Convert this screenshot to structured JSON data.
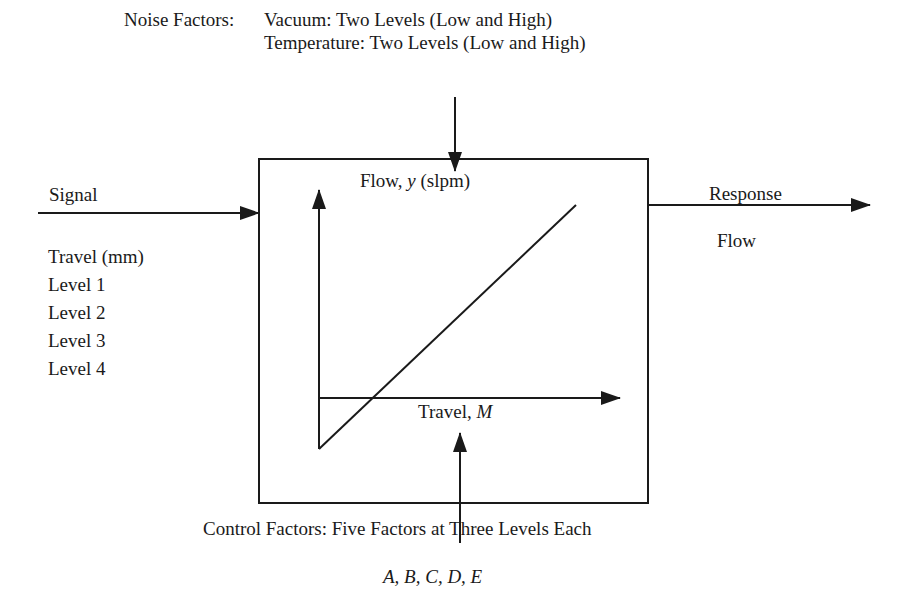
{
  "noise": {
    "label": "Noise Factors:",
    "line1": "Vacuum:  Two Levels (Low and High)",
    "line2": "Temperature: Two Levels (Low and High)"
  },
  "signal": {
    "label": "Signal",
    "heading": "Travel (mm)",
    "levels": [
      "Level 1",
      "Level 2",
      "Level 3",
      "Level 4"
    ]
  },
  "response": {
    "label": "Response",
    "value": "Flow"
  },
  "plot": {
    "y_label_prefix": "Flow, ",
    "y_label_var": "y",
    "y_label_suffix": " (slpm)",
    "x_label_prefix": "Travel, ",
    "x_label_var": "M"
  },
  "control": {
    "label": "Control Factors: Five Factors at Three Levels Each",
    "factors": "A, B, C, D, E"
  },
  "colors": {
    "stroke": "#1a1a1a",
    "background": "#ffffff"
  }
}
